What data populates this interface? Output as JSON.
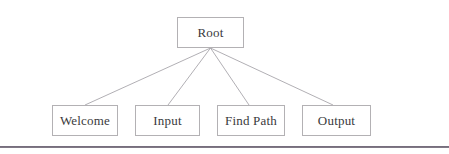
{
  "diagram": {
    "type": "tree",
    "title": "",
    "root": {
      "id": "root",
      "label": "Root"
    },
    "children": [
      {
        "id": "welcome",
        "label": "Welcome"
      },
      {
        "id": "input",
        "label": "Input"
      },
      {
        "id": "findpath",
        "label": "Find Path"
      },
      {
        "id": "output",
        "label": "Output"
      }
    ],
    "edges": [
      {
        "from": "root",
        "to": "welcome"
      },
      {
        "from": "root",
        "to": "input"
      },
      {
        "from": "root",
        "to": "findpath"
      },
      {
        "from": "root",
        "to": "output"
      }
    ],
    "colors": {
      "node_border": "#b3b1b4",
      "node_fill": "#ffffff",
      "edge": "#a8a6ab",
      "text": "#3a3a3c",
      "rule": "#5f5766",
      "background": "#ffffff"
    }
  }
}
